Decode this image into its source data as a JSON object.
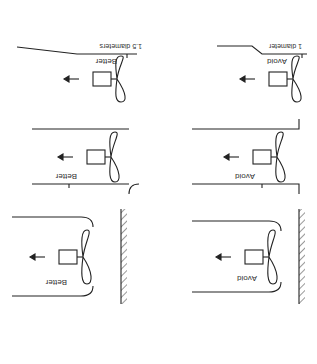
{
  "orientation": "rotated-180",
  "caption_fragment": "",
  "panels": [
    {
      "row": "top",
      "side": "left",
      "label": "Avoid",
      "type": "abrupt-inlet-near-wall",
      "dimension": "1 diameter"
    },
    {
      "row": "top",
      "side": "right",
      "label": "Better",
      "type": "bell-inlet-near-wall",
      "dimension": "1.5 diameters"
    },
    {
      "row": "middle",
      "side": "left",
      "label": "Avoid",
      "type": "straight-duct-square-edge"
    },
    {
      "row": "middle",
      "side": "right",
      "label": "Better",
      "type": "straight-duct-rounded-edge"
    },
    {
      "row": "bottom",
      "side": "left",
      "label": "Avoid",
      "type": "abrupt-transition"
    },
    {
      "row": "bottom",
      "side": "right",
      "label": "Better",
      "type": "gradual-transition"
    }
  ],
  "colors": {
    "line": "#222222",
    "text": "#333333",
    "background": "#ffffff"
  }
}
